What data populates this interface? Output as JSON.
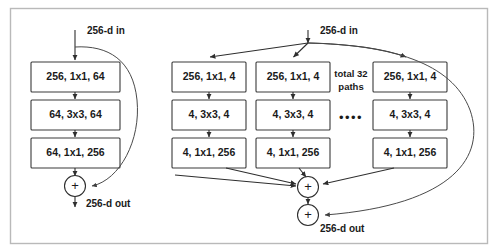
{
  "figure": {
    "background_color": "#ffffff",
    "border_color": "#b9b9b9",
    "line_color": "#2e2e2e"
  },
  "left_block": {
    "input_label": "256-d in",
    "output_label": "256-d out",
    "sum_symbol": "+",
    "layers": [
      {
        "label": "256, 1x1, 64"
      },
      {
        "label": "64, 3x3, 64"
      },
      {
        "label": "64, 1x1, 256"
      }
    ]
  },
  "right_block": {
    "input_label": "256-d in",
    "output_label": "256-d out",
    "sum_symbol": "+",
    "paths_label_line1": "total 32",
    "paths_label_line2": "paths",
    "ellipsis": "••••",
    "paths": [
      {
        "layers": [
          {
            "label": "256, 1x1, 4"
          },
          {
            "label": "4, 3x3, 4"
          },
          {
            "label": "4, 1x1, 256"
          }
        ]
      },
      {
        "layers": [
          {
            "label": "256, 1x1, 4"
          },
          {
            "label": "4, 3x3, 4"
          },
          {
            "label": "4, 1x1, 256"
          }
        ]
      },
      {
        "layers": [
          {
            "label": "256, 1x1, 4"
          },
          {
            "label": "4, 3x3, 4"
          },
          {
            "label": "4, 1x1, 256"
          }
        ]
      }
    ]
  }
}
